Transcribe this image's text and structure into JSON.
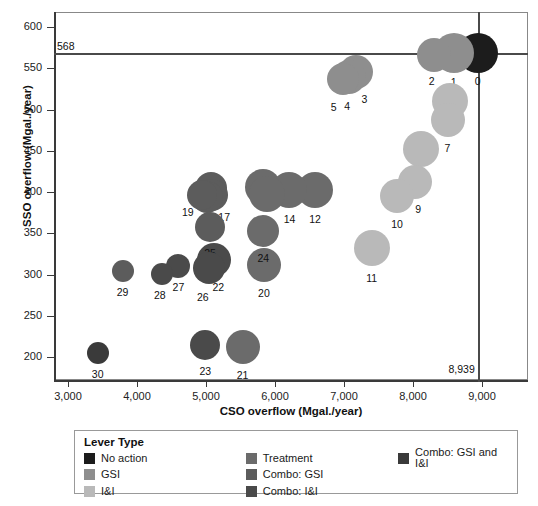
{
  "chart_data": {
    "type": "scatter",
    "title": "",
    "xlabel": "CSO overflow (Mgal./year)",
    "ylabel": "SSO overflow (Mgal./year)",
    "xlim": [
      2600,
      9400
    ],
    "ylim": [
      180,
      620
    ],
    "xticks": [
      3000,
      4000,
      5000,
      6000,
      7000,
      8000,
      9000
    ],
    "xticklabels": [
      "3,000",
      "4,000",
      "5,000",
      "6,000",
      "7,000",
      "8,000",
      "9,000"
    ],
    "yticks": [
      200,
      250,
      300,
      350,
      400,
      450,
      500,
      550,
      600
    ],
    "yticklabels": [
      "200",
      "250",
      "300",
      "350",
      "400",
      "450",
      "500",
      "550",
      "600"
    ],
    "grid": false,
    "legend_position": "below",
    "reference_lines": [
      {
        "axis": "y",
        "value": 568,
        "label": "568"
      },
      {
        "axis": "x",
        "value": 8939,
        "label": "8,939"
      }
    ],
    "points": [
      {
        "label": "0",
        "x": 8939,
        "y": 568,
        "size": 20,
        "category": "No action"
      },
      {
        "label": "1",
        "x": 8590,
        "y": 568,
        "size": 20,
        "category": "GSI"
      },
      {
        "label": "2",
        "x": 8300,
        "y": 566,
        "size": 17,
        "category": "GSI"
      },
      {
        "label": "3",
        "x": 7180,
        "y": 545,
        "size": 17,
        "category": "GSI"
      },
      {
        "label": "4",
        "x": 7075,
        "y": 540,
        "size": 17,
        "category": "GSI"
      },
      {
        "label": "5",
        "x": 6980,
        "y": 537,
        "size": 16,
        "category": "GSI"
      },
      {
        "label": "6",
        "x": 8530,
        "y": 510,
        "size": 18,
        "category": "I&I"
      },
      {
        "label": "7",
        "x": 8500,
        "y": 487,
        "size": 17,
        "category": "I&I"
      },
      {
        "label": "8",
        "x": 8120,
        "y": 452,
        "size": 18,
        "category": "I&I"
      },
      {
        "label": "9",
        "x": 8030,
        "y": 412,
        "size": 17,
        "category": "I&I"
      },
      {
        "label": "10",
        "x": 7770,
        "y": 395,
        "size": 17,
        "category": "I&I"
      },
      {
        "label": "11",
        "x": 7400,
        "y": 332,
        "size": 18,
        "category": "I&I"
      },
      {
        "label": "12",
        "x": 6580,
        "y": 403,
        "size": 18,
        "category": "Treatment"
      },
      {
        "label": "13",
        "x": 5830,
        "y": 406,
        "size": 18,
        "category": "Treatment"
      },
      {
        "label": "14",
        "x": 6210,
        "y": 402,
        "size": 18,
        "category": "Treatment"
      },
      {
        "label": "15",
        "x": 5880,
        "y": 398,
        "size": 18,
        "category": "Treatment"
      },
      {
        "label": "16",
        "x": 5070,
        "y": 405,
        "size": 16,
        "category": "Combo: GSI"
      },
      {
        "label": "17",
        "x": 5090,
        "y": 396,
        "size": 16,
        "category": "Combo: GSI"
      },
      {
        "label": "18",
        "x": 5010,
        "y": 394,
        "size": 16,
        "category": "Combo: GSI"
      },
      {
        "label": "19",
        "x": 4940,
        "y": 396,
        "size": 15,
        "category": "Combo: GSI"
      },
      {
        "label": "20",
        "x": 5840,
        "y": 312,
        "size": 17,
        "category": "Treatment"
      },
      {
        "label": "21",
        "x": 5530,
        "y": 212,
        "size": 17,
        "category": "Treatment"
      },
      {
        "label": "22",
        "x": 5120,
        "y": 317,
        "size": 17,
        "category": "Combo: I&I"
      },
      {
        "label": "23",
        "x": 4990,
        "y": 215,
        "size": 15,
        "category": "Combo: I&I"
      },
      {
        "label": "24",
        "x": 5830,
        "y": 353,
        "size": 16,
        "category": "Treatment"
      },
      {
        "label": "25",
        "x": 5060,
        "y": 358,
        "size": 15,
        "category": "Combo: GSI"
      },
      {
        "label": "26",
        "x": 5040,
        "y": 308,
        "size": 16,
        "category": "Combo: I&I"
      },
      {
        "label": "27",
        "x": 4600,
        "y": 310,
        "size": 12,
        "category": "Combo: I&I"
      },
      {
        "label": "28",
        "x": 4360,
        "y": 301,
        "size": 11,
        "category": "Combo: I&I"
      },
      {
        "label": "29",
        "x": 3790,
        "y": 304,
        "size": 11,
        "category": "Combo: GSI"
      },
      {
        "label": "30",
        "x": 3430,
        "y": 205,
        "size": 11,
        "category": "Combo: GSI and I&I"
      }
    ],
    "categories": [
      {
        "name": "No action",
        "color": "#1c1c1c"
      },
      {
        "name": "GSI",
        "color": "#8e8e8e"
      },
      {
        "name": "I&I",
        "color": "#b9b9b9"
      },
      {
        "name": "Treatment",
        "color": "#6b6b6b"
      },
      {
        "name": "Combo: GSI",
        "color": "#5c5c5c"
      },
      {
        "name": "Combo: I&I",
        "color": "#4a4a4a"
      },
      {
        "name": "Combo: GSI and I&I",
        "color": "#3a3a3a"
      }
    ]
  },
  "legend": {
    "title": "Lever Type",
    "columns": [
      [
        {
          "label": "No action",
          "color": "#1c1c1c"
        },
        {
          "label": "GSI",
          "color": "#8e8e8e"
        },
        {
          "label": "I&I",
          "color": "#b9b9b9"
        }
      ],
      [
        {
          "label": "Treatment",
          "color": "#6b6b6b"
        },
        {
          "label": "Combo: GSI",
          "color": "#5c5c5c"
        },
        {
          "label": "Combo: I&I",
          "color": "#4a4a4a"
        }
      ],
      [
        {
          "label": "Combo: GSI and I&I",
          "color": "#3a3a3a"
        }
      ]
    ]
  }
}
